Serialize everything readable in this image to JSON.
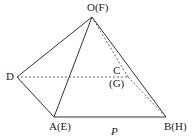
{
  "figure": {
    "type": "pyramid-diagram",
    "plane_label": "P",
    "points": {
      "O": {
        "label": "O(F)",
        "x": 92,
        "y": 17
      },
      "D": {
        "label": "D",
        "x": 17,
        "y": 77
      },
      "A": {
        "label": "A(E)",
        "x": 54,
        "y": 117
      },
      "B": {
        "label": "B(H)",
        "x": 166,
        "y": 117
      },
      "C": {
        "label": "C",
        "x": 128,
        "y": 77
      },
      "G": {
        "label": "(G)"
      }
    },
    "solid_edges": [
      "OD",
      "OA",
      "OB",
      "DA",
      "AB"
    ],
    "dashed_edges": [
      "OC",
      "DC",
      "CB"
    ],
    "colors": {
      "line": "#333333",
      "dashed": "#555555",
      "text": "#222222"
    }
  }
}
